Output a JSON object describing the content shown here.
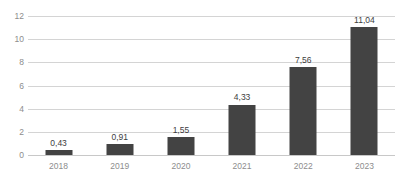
{
  "chart_data": {
    "type": "bar",
    "title": "",
    "subtitle": "",
    "xlabel": "",
    "ylabel": "",
    "categories": [
      "2018",
      "2019",
      "2020",
      "2021",
      "2022",
      "2023"
    ],
    "values": [
      0.43,
      0.91,
      1.55,
      4.33,
      7.56,
      11.04
    ],
    "value_labels": [
      "0,43",
      "0,91",
      "1,55",
      "4,33",
      "7,56",
      "11,04"
    ],
    "decimal_separator": ",",
    "ylim": [
      0,
      12
    ],
    "ytick_values": [
      12,
      10,
      8,
      6,
      4,
      2,
      0
    ],
    "ytick_labels": [
      "12",
      "10",
      "8",
      "6",
      "4",
      "2",
      "0"
    ],
    "grid": true,
    "grid_axis": "y",
    "legend": false,
    "legend_position": "none",
    "series": [
      {
        "name": "",
        "values": [
          0.43,
          0.91,
          1.55,
          4.33,
          7.56,
          11.04
        ]
      }
    ]
  },
  "style": {
    "bar_color": "#434343",
    "gridline_color": "#d4d4d4",
    "baseline_color": "#c8c8c8",
    "tick_label_color": "#8d8d8d",
    "value_label_color": "#3d3d3d",
    "background": "#ffffff"
  }
}
